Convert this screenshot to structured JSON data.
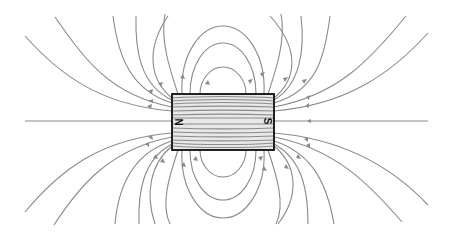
{
  "diagram": {
    "magnet": {
      "north_label": "N",
      "south_label": "S",
      "body_color": "#e8e8e8",
      "outline_color": "#1a1a1a"
    },
    "field_line_color": "#8a8a8a",
    "background": "#ffffff"
  }
}
